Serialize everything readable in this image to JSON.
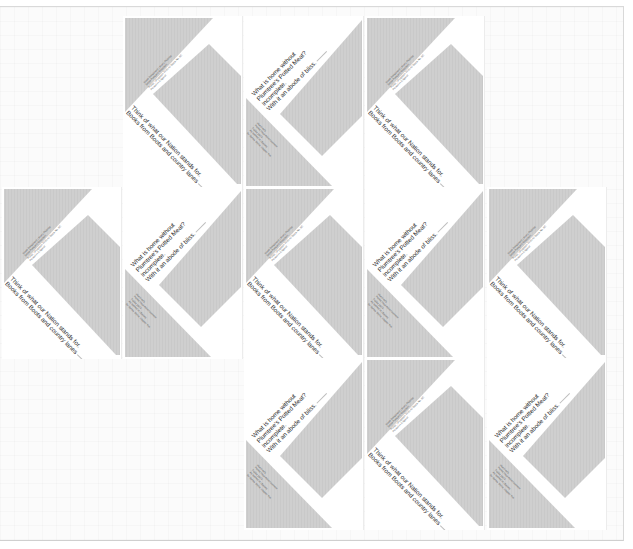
{
  "layout": {
    "columns": 5,
    "rows": 3,
    "grid": [
      [
        "blank",
        "A",
        "B",
        "A",
        "blank"
      ],
      [
        "A",
        "B",
        "A",
        "B",
        "A"
      ],
      [
        "blank",
        "blank",
        "B",
        "A",
        "B"
      ]
    ]
  },
  "colors": {
    "shape_fill": "#cfcfcf",
    "tile_background": "#ffffff",
    "page_background": "#fbfbfb",
    "text": "#2b2b2b"
  },
  "tile_a": {
    "caption_line_1": "Think of what our Nation stands for.",
    "caption_line_2": "Books from Boots and country lanes",
    "fine_print": [
      "Boots Booklovers Library Pictorial",
      "Sepia Postcard Collection",
      "Photo: Lithograph 1930-40 Stock No. 8C",
      "Printed in England"
    ]
  },
  "tile_b": {
    "caption_line_1": "What is home without",
    "caption_line_2": "Plumtree's Potted Meat?",
    "caption_line_3": "Incomplete.",
    "caption_line_4": "With it an abode of bliss.",
    "fine_print": [
      "Plumtree's",
      "Potted Meat Advertisement",
      "Dublin 1904",
      "As quoted in Ulysses",
      "by James Joyce, chapter five"
    ]
  }
}
